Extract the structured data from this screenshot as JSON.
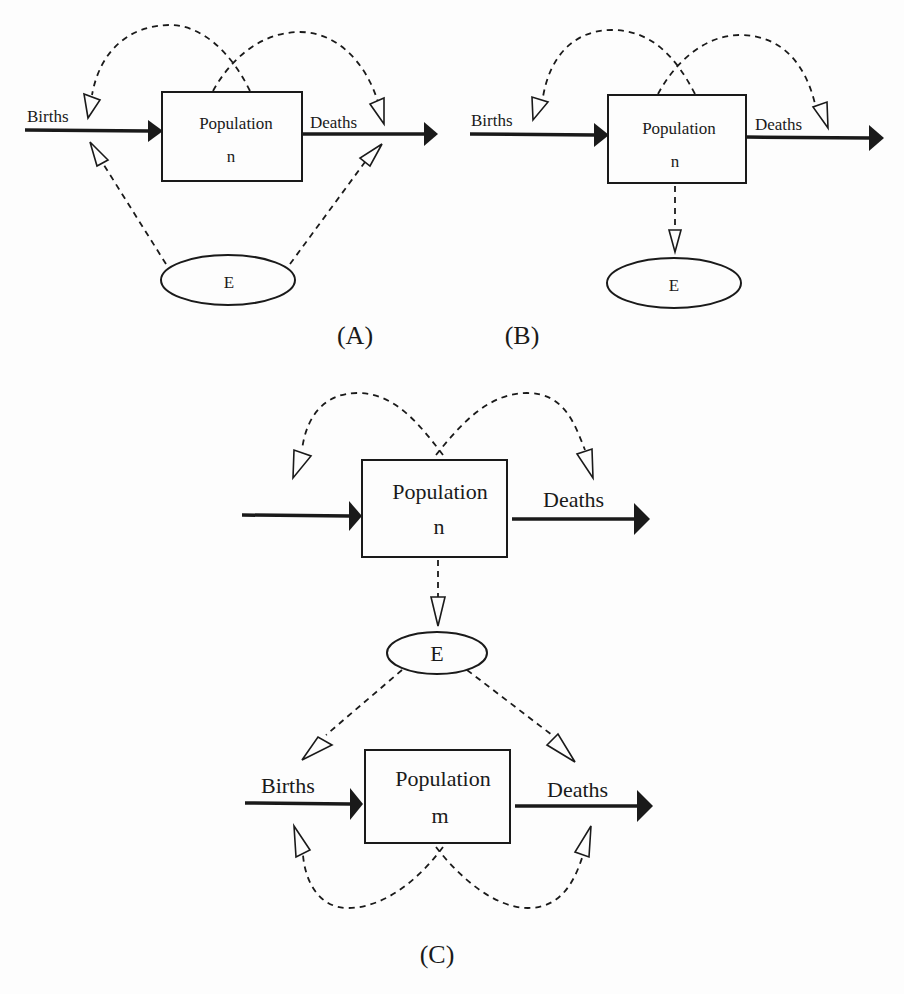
{
  "panels": {
    "A": {
      "caption": "(A)",
      "stock_label": "Population",
      "stock_var": "n",
      "inflow_label": "Births",
      "outflow_label": "Deaths",
      "env_label": "E"
    },
    "B": {
      "caption": "(B)",
      "stock_label": "Population",
      "stock_var": "n",
      "inflow_label": "Births",
      "outflow_label": "Deaths",
      "env_label": "E"
    },
    "C": {
      "caption": "(C)",
      "top": {
        "stock_label": "Population",
        "stock_var": "n",
        "outflow_label": "Deaths"
      },
      "env_label": "E",
      "bottom": {
        "stock_label": "Population",
        "stock_var": "m",
        "inflow_label": "Births",
        "outflow_label": "Deaths"
      }
    }
  },
  "colors": {
    "ink": "#1a1a1a",
    "background": "#fdfdfd"
  }
}
